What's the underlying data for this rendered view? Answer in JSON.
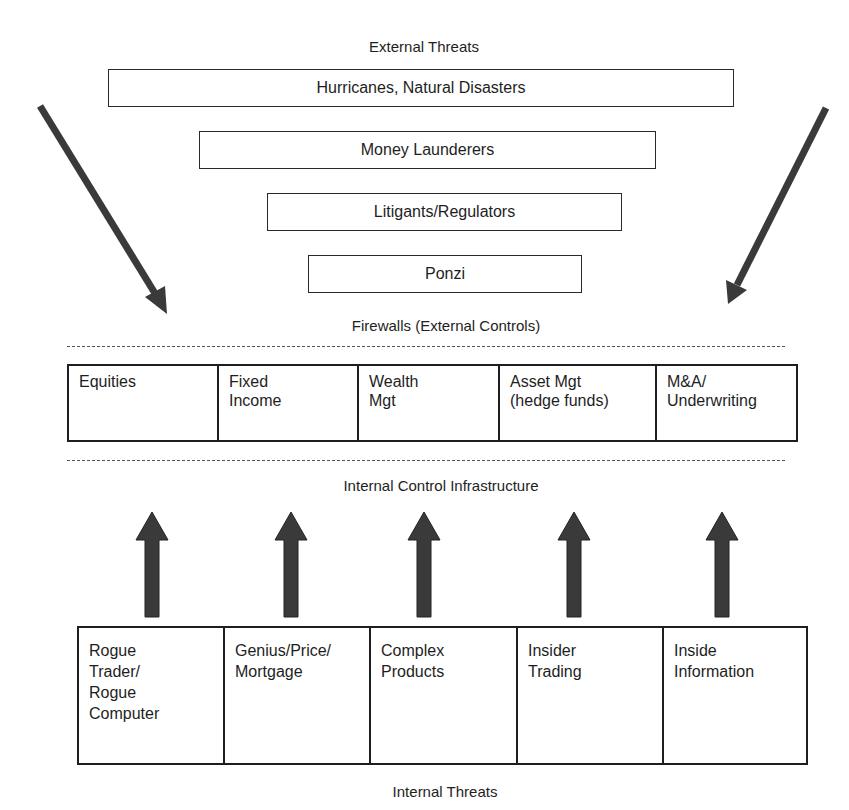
{
  "external": {
    "title": "External Threats",
    "threats": [
      {
        "label": "Hurricanes, Natural Disasters"
      },
      {
        "label": "Money Launderers"
      },
      {
        "label": "Litigants/Regulators"
      },
      {
        "label": "Ponzi"
      }
    ]
  },
  "firewalls_label": "Firewalls (External Controls)",
  "business_lines": [
    {
      "label": "Equities"
    },
    {
      "label": "Fixed\nIncome"
    },
    {
      "label": "Wealth\nMgt"
    },
    {
      "label": "Asset Mgt\n(hedge funds)"
    },
    {
      "label": "M&A/\nUnderwriting"
    }
  ],
  "internal_control_label": "Internal Control Infrastructure",
  "internal": {
    "threats": [
      {
        "label": "Rogue\nTrader/\nRogue\nComputer"
      },
      {
        "label": "Genius/Price/\nMortgage"
      },
      {
        "label": "Complex\nProducts"
      },
      {
        "label": "Insider\nTrading"
      },
      {
        "label": "Inside\nInformation"
      }
    ],
    "title": "Internal Threats"
  },
  "colors": {
    "arrow": "#3a3a3a",
    "line": "#1e1e1e"
  }
}
